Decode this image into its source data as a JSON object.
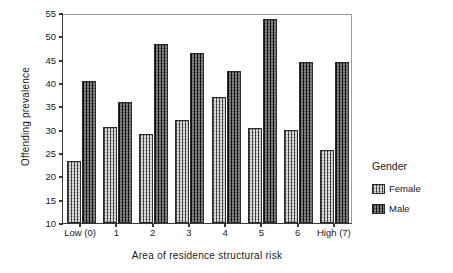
{
  "chart_data": {
    "type": "bar",
    "title": "",
    "xlabel": "Area of residence structural risk",
    "ylabel": "Offending prevalence",
    "categories": [
      "Low (0)",
      "1",
      "2",
      "3",
      "4",
      "5",
      "6",
      "High (7)"
    ],
    "series": [
      {
        "name": "Female",
        "values": [
          23.2,
          30.6,
          29.0,
          32.1,
          36.9,
          30.4,
          29.9,
          25.7
        ]
      },
      {
        "name": "Male",
        "values": [
          40.4,
          35.9,
          48.3,
          46.5,
          42.6,
          53.8,
          44.4,
          44.4
        ]
      }
    ],
    "ylim": [
      10,
      55
    ],
    "yticks": [
      10,
      15,
      20,
      25,
      30,
      35,
      40,
      45,
      50,
      55
    ],
    "ytick_labels": [
      "10",
      "15",
      "20",
      "25",
      "30",
      "35",
      "40",
      "45",
      "50",
      "55"
    ],
    "grid": false,
    "legend_position": "right",
    "legend": {
      "title": "Gender",
      "entries": [
        {
          "label": "Female",
          "swatch": "light-crosshatch"
        },
        {
          "label": "Male",
          "swatch": "dark-crosshatch"
        }
      ]
    }
  }
}
